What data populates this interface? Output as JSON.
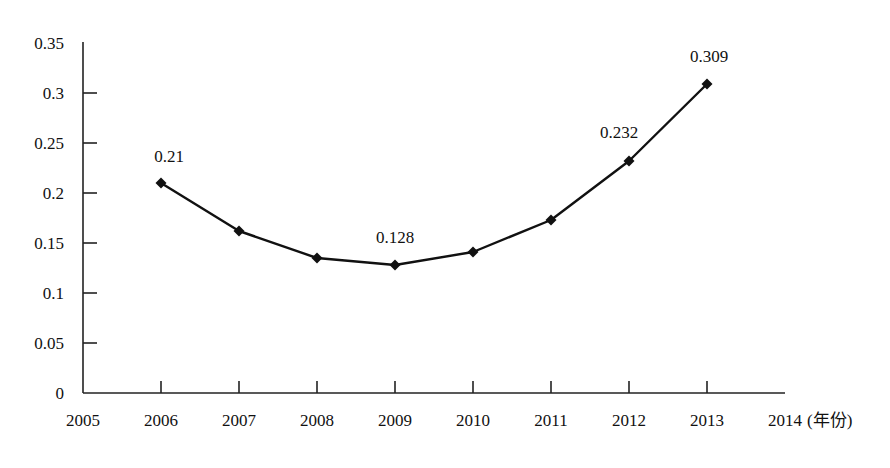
{
  "chart_data": {
    "type": "line",
    "title": "",
    "xlabel": "(年份)",
    "ylabel": "",
    "x": [
      2006,
      2007,
      2008,
      2009,
      2010,
      2011,
      2012,
      2013
    ],
    "series": [
      {
        "name": "",
        "values": [
          0.21,
          0.162,
          0.135,
          0.128,
          0.141,
          0.173,
          0.232,
          0.309
        ],
        "marker": "diamond",
        "color": "#111111"
      }
    ],
    "data_labels": [
      {
        "x": 2006,
        "text": "0.21"
      },
      {
        "x": 2009,
        "text": "0.128"
      },
      {
        "x": 2012,
        "text": "0.232"
      },
      {
        "x": 2013,
        "text": "0.309"
      }
    ],
    "x_ticks": [
      "2005",
      "2006",
      "2007",
      "2008",
      "2009",
      "2010",
      "2011",
      "2012",
      "2013",
      "2014"
    ],
    "x_axis_unit": "(年份)",
    "y_ticks": [
      "0",
      "0.05",
      "0.1",
      "0.15",
      "0.2",
      "0.25",
      "0.3",
      "0.35"
    ],
    "xlim": [
      2005,
      2014
    ],
    "ylim": [
      0,
      0.35
    ],
    "grid": false,
    "legend": "none"
  }
}
